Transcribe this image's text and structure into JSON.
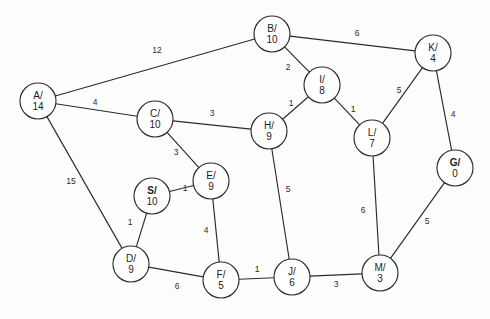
{
  "diagram": {
    "width": 490,
    "height": 319,
    "background_color": "#fdfdfd",
    "stroke_color": "#2b2b2b",
    "node_fill_color": "#ffffff",
    "node_radius": 18
  },
  "chart_data": {
    "type": "diagram",
    "node_label_format": "ID/value",
    "nodes": [
      {
        "id": "A",
        "value": "14",
        "label_top": "A/",
        "label_bottom": "14",
        "x": 38,
        "y": 101,
        "bold": false
      },
      {
        "id": "B",
        "value": "10",
        "label_top": "B/",
        "label_bottom": "10",
        "x": 272,
        "y": 34,
        "bold": false
      },
      {
        "id": "C",
        "value": "10",
        "label_top": "C/",
        "label_bottom": "10",
        "x": 155,
        "y": 119,
        "bold": false
      },
      {
        "id": "D",
        "value": "9",
        "label_top": "D/",
        "label_bottom": "9",
        "x": 131,
        "y": 264,
        "bold": false
      },
      {
        "id": "E",
        "value": "9",
        "label_top": "E/",
        "label_bottom": "9",
        "x": 211,
        "y": 181,
        "bold": false
      },
      {
        "id": "F",
        "value": "5",
        "label_top": "F/",
        "label_bottom": "5",
        "x": 221,
        "y": 280,
        "bold": false
      },
      {
        "id": "G",
        "value": "0",
        "label_top": "G/",
        "label_bottom": "0",
        "x": 455,
        "y": 168,
        "bold": true
      },
      {
        "id": "H",
        "value": "9",
        "label_top": "H/",
        "label_bottom": "9",
        "x": 269,
        "y": 131,
        "bold": false
      },
      {
        "id": "I",
        "value": "8",
        "label_top": "I/",
        "label_bottom": "8",
        "x": 322,
        "y": 85,
        "bold": false
      },
      {
        "id": "J",
        "value": "6",
        "label_top": "J/",
        "label_bottom": "6",
        "x": 292,
        "y": 277,
        "bold": false
      },
      {
        "id": "K",
        "value": "4",
        "label_top": "K/",
        "label_bottom": "4",
        "x": 433,
        "y": 53,
        "bold": false
      },
      {
        "id": "L",
        "value": "7",
        "label_top": "L/",
        "label_bottom": "7",
        "x": 372,
        "y": 138,
        "bold": false
      },
      {
        "id": "M",
        "value": "3",
        "label_top": "M/",
        "label_bottom": "3",
        "x": 380,
        "y": 273,
        "bold": false
      },
      {
        "id": "S",
        "value": "10",
        "label_top": "S/",
        "label_bottom": "10",
        "x": 152,
        "y": 196,
        "bold": true
      }
    ],
    "edges": [
      {
        "from": "A",
        "to": "B",
        "weight": "12",
        "label_x": 157,
        "label_y": 51
      },
      {
        "from": "A",
        "to": "C",
        "weight": "4",
        "label_x": 95,
        "label_y": 103
      },
      {
        "from": "A",
        "to": "D",
        "weight": "15",
        "label_x": 71,
        "label_y": 182
      },
      {
        "from": "B",
        "to": "K",
        "weight": "6",
        "label_x": 357,
        "label_y": 34
      },
      {
        "from": "B",
        "to": "I",
        "weight": "2",
        "label_x": 288,
        "label_y": 68
      },
      {
        "from": "C",
        "to": "H",
        "weight": "3",
        "label_x": 212,
        "label_y": 114
      },
      {
        "from": "C",
        "to": "E",
        "weight": "3",
        "label_x": 176,
        "label_y": 153
      },
      {
        "from": "S",
        "to": "E",
        "weight": "1",
        "label_x": 185,
        "label_y": 189
      },
      {
        "from": "S",
        "to": "D",
        "weight": "1",
        "label_x": 130,
        "label_y": 223
      },
      {
        "from": "E",
        "to": "F",
        "weight": "4",
        "label_x": 206,
        "label_y": 231
      },
      {
        "from": "D",
        "to": "F",
        "weight": "6",
        "label_x": 177,
        "label_y": 287
      },
      {
        "from": "F",
        "to": "J",
        "weight": "1",
        "label_x": 257,
        "label_y": 270
      },
      {
        "from": "J",
        "to": "M",
        "weight": "3",
        "label_x": 336,
        "label_y": 285
      },
      {
        "from": "H",
        "to": "I",
        "weight": "1",
        "label_x": 291,
        "label_y": 104
      },
      {
        "from": "H",
        "to": "J",
        "weight": "5",
        "label_x": 288,
        "label_y": 190
      },
      {
        "from": "I",
        "to": "L",
        "weight": "1",
        "label_x": 353,
        "label_y": 110
      },
      {
        "from": "K",
        "to": "L",
        "weight": "5",
        "label_x": 399,
        "label_y": 91
      },
      {
        "from": "K",
        "to": "G",
        "weight": "4",
        "label_x": 453,
        "label_y": 115
      },
      {
        "from": "L",
        "to": "M",
        "weight": "6",
        "label_x": 363,
        "label_y": 211
      },
      {
        "from": "G",
        "to": "M",
        "weight": "5",
        "label_x": 427,
        "label_y": 222
      }
    ]
  }
}
